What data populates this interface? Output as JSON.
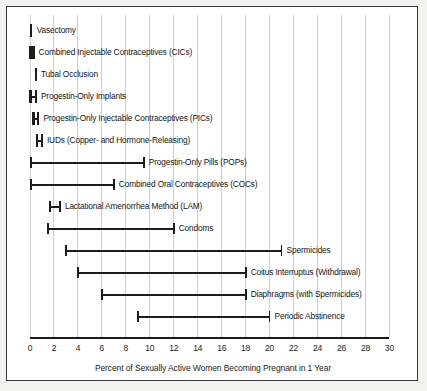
{
  "figure": {
    "background_color": "#f2f2f0",
    "frame_color": "#3a3a3a",
    "plot_background": "#ffffff",
    "ink_color": "#1c1c1c",
    "grid_color": "#cfcfcf"
  },
  "axis": {
    "title": "Percent of Sexually Active Women Becoming Pregnant in 1 Year",
    "min": 0,
    "max": 30,
    "tick_step": 2,
    "tick_labels": [
      "0",
      "2",
      "4",
      "6",
      "8",
      "10",
      "12",
      "14",
      "16",
      "18",
      "20",
      "22",
      "24",
      "26",
      "28",
      "30"
    ]
  },
  "chart_data": {
    "type": "range",
    "title": "",
    "subtitle": "",
    "xlabel": "Percent of Sexually Active Women Becoming Pregnant in 1 Year",
    "ylabel": "",
    "xlim": [
      0,
      30
    ],
    "xticks": [
      0,
      2,
      4,
      6,
      8,
      10,
      12,
      14,
      16,
      18,
      20,
      22,
      24,
      26,
      28,
      30
    ],
    "grid": true,
    "legend": "none",
    "orientation": "horizontal",
    "categories": [
      "Vasectomy",
      "Combined Injectable Contraceptives (CICs)",
      "Tubal Occlusion",
      "Progestin-Only Implants",
      "Progestin-Only Injectable Contraceptives (PICs)",
      "IUDs (Copper- and Hormone-Releasing)",
      "Progestin-Only Pills (POPs)",
      "Combined Oral Contraceptives (COCs)",
      "Lactational Amenorrhea Method (LAM)",
      "Condoms",
      "Spermicides",
      "Coitus Interruptus (Withdrawal)",
      "Diaphragms (with Spermicides)",
      "Periodic Abstinence"
    ],
    "ranges": [
      {
        "label": "Vasectomy",
        "low": 0.1,
        "high": 0.15
      },
      {
        "label": "Combined Injectable Contraceptives (CICs)",
        "low": 0.05,
        "high": 0.3
      },
      {
        "label": "Tubal Occlusion",
        "low": 0.5,
        "high": 0.5
      },
      {
        "label": "Progestin-Only Implants",
        "low": 0.05,
        "high": 0.5
      },
      {
        "label": "Progestin-Only Injectable Contraceptives (PICs)",
        "low": 0.3,
        "high": 0.7
      },
      {
        "label": "IUDs (Copper- and Hormone-Releasing)",
        "low": 0.6,
        "high": 1.0
      },
      {
        "label": "Progestin-Only Pills (POPs)",
        "low": 0.1,
        "high": 9.5
      },
      {
        "label": "Combined Oral Contraceptives (COCs)",
        "low": 0.1,
        "high": 7.0
      },
      {
        "label": "Lactational Amenorrhea Method (LAM)",
        "low": 1.7,
        "high": 2.5
      },
      {
        "label": "Condoms",
        "low": 1.5,
        "high": 12.0
      },
      {
        "label": "Spermicides",
        "low": 3.0,
        "high": 21.0
      },
      {
        "label": "Coitus Interruptus (Withdrawal)",
        "low": 4.0,
        "high": 18.0
      },
      {
        "label": "Diaphragms (with Spermicides)",
        "low": 6.0,
        "high": 18.0
      },
      {
        "label": "Periodic Abstinence",
        "low": 9.0,
        "high": 20.0
      }
    ]
  }
}
